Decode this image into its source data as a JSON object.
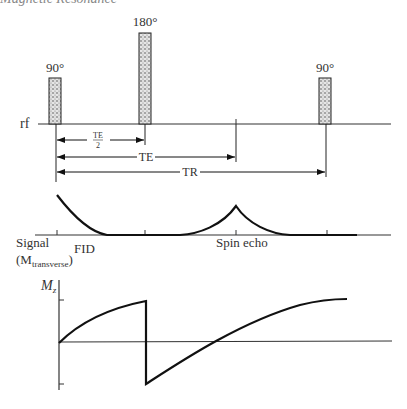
{
  "header": {
    "partial_title": "Magnetic Resonance"
  },
  "rf_panel": {
    "axis_label": "rf",
    "pulses": [
      {
        "label": "90°",
        "x": 55
      },
      {
        "label": "180°",
        "x": 145
      },
      {
        "label": "90°",
        "x": 325
      }
    ],
    "timing": [
      {
        "label_num": "TE",
        "label_den": "2",
        "start": 56,
        "end": 145
      },
      {
        "label": "TE",
        "start": 56,
        "end": 236
      },
      {
        "label": "TR",
        "start": 56,
        "end": 326
      }
    ]
  },
  "signal_panel": {
    "axis_label_line1": "Signal",
    "axis_label_line2_prefix": "(M",
    "axis_label_line2_sub": "transverse",
    "axis_label_line2_suffix": ")",
    "fid_label": "FID",
    "echo_label": "Spin echo"
  },
  "mz_panel": {
    "axis_label": "M",
    "axis_label_sub": "z"
  },
  "colors": {
    "stroke": "#111111",
    "pulse_fill": "#bdbdbd",
    "text": "#333333"
  }
}
